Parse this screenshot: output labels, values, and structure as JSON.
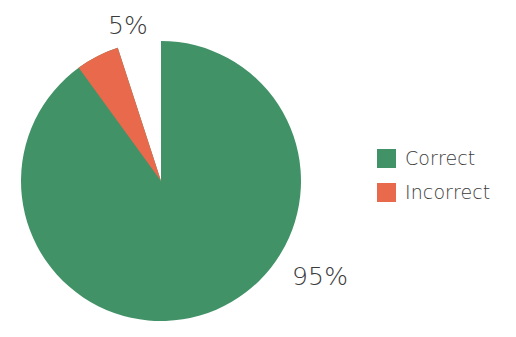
{
  "chart_data": {
    "type": "pie",
    "title": "",
    "subtitle": "",
    "xlabel": "",
    "ylabel": "",
    "categories": [
      "Correct",
      "Incorrect"
    ],
    "values": [
      95,
      5
    ],
    "value_unit": "%",
    "data_labels": [
      "95%",
      "5%"
    ],
    "colors": [
      "#429268",
      "#e8694b"
    ],
    "legend_position": "right",
    "grid": false,
    "start_angle_deg": 90,
    "direction": "counterclockwise",
    "slices": [
      {
        "name": "Correct",
        "value": 95,
        "label": "95%",
        "color": "#429268"
      },
      {
        "name": "Incorrect",
        "value": 5,
        "label": "5%",
        "color": "#e8694b"
      }
    ]
  },
  "labels": {
    "incorrect_pct": "5%",
    "correct_pct": "95%"
  },
  "legend": {
    "items": [
      {
        "label": "Correct",
        "color": "#429268"
      },
      {
        "label": "Incorrect",
        "color": "#e8694b"
      }
    ]
  }
}
